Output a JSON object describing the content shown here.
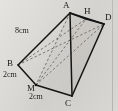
{
  "figure": {
    "kind": "3d-solid-geometry-diagram",
    "background_color": "#d9d7d3",
    "line_color": "#1a1a1a",
    "hidden_line_color": "#6f6f6f",
    "shade_color": "#c9c7c3"
  },
  "vertices": [
    {
      "id": "A",
      "label": "A",
      "x": 66,
      "y": 5
    },
    {
      "id": "H",
      "label": "H",
      "x": 87,
      "y": 11
    },
    {
      "id": "D",
      "label": "D",
      "x": 107,
      "y": 17
    },
    {
      "id": "B",
      "label": "B",
      "x": 10,
      "y": 63
    },
    {
      "id": "M",
      "label": "M",
      "x": 29,
      "y": 87
    },
    {
      "id": "C",
      "label": "C",
      "x": 68,
      "y": 101
    }
  ],
  "measurements": [
    {
      "id": "AB",
      "label": "8cm",
      "x": 16,
      "y": 29
    },
    {
      "id": "BM",
      "label": "2cm",
      "x": 5,
      "y": 74
    },
    {
      "id": "MC",
      "label": "2cm",
      "x": 31,
      "y": 96
    }
  ],
  "edges": {
    "solid": [
      "A-B",
      "A-C",
      "A-D",
      "B-M",
      "M-C",
      "C-D",
      "A-H",
      "H-D"
    ],
    "dashed": [
      "B-D",
      "M-D",
      "M-H",
      "M-A",
      "B-H",
      "A-M"
    ]
  }
}
